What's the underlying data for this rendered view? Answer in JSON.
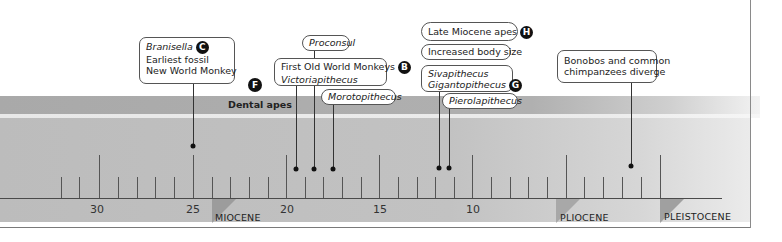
{
  "diagram": {
    "type": "timeline",
    "axis_unit": "millions of years ago",
    "tick_labels": [
      {
        "value": "30",
        "x": 97
      },
      {
        "value": "25",
        "x": 193
      },
      {
        "value": "20",
        "x": 287
      },
      {
        "value": "15",
        "x": 380
      },
      {
        "value": "10",
        "x": 473
      },
      {
        "value": "5",
        "x": 565
      }
    ],
    "major_ticks_x": [
      99,
      193,
      286,
      379,
      472,
      566,
      660
    ],
    "minor_ticks_x": [
      61,
      79,
      118,
      137,
      155,
      174,
      212,
      230,
      249,
      268,
      305,
      323,
      342,
      361,
      398,
      417,
      435,
      454,
      491,
      510,
      528,
      547,
      584,
      603,
      622,
      641
    ],
    "epochs": [
      {
        "label": "MIOCENE",
        "x": 212
      },
      {
        "label": "PLIOCENE",
        "x": 556
      },
      {
        "label": "PLEISTOCENE",
        "x": 660
      }
    ],
    "band": {
      "label": "Dental apes",
      "badge": "F"
    },
    "events": [
      {
        "id": "branisella",
        "lines": [
          "Branisella",
          "Earliest fossil",
          "New World Monkey"
        ],
        "italic_first": true,
        "badge": "C",
        "dot_x": 193,
        "dot_y": 146
      },
      {
        "id": "proconsul",
        "lines": [
          "Proconsul"
        ],
        "dot_x": 314,
        "dot_y": 169
      },
      {
        "id": "old-world",
        "lines": [
          "First Old World Monkeys",
          "Victoriapithecus"
        ],
        "badge": "B",
        "dot_x": 296,
        "dot_y": 169
      },
      {
        "id": "morotopithecus",
        "lines": [
          "Morotopithecus"
        ],
        "dot_x": 333,
        "dot_y": 169
      },
      {
        "id": "late-miocene",
        "lines": [
          "Late Miocene apes"
        ],
        "badge": "H"
      },
      {
        "id": "body-size",
        "lines": [
          "Increased body size"
        ]
      },
      {
        "id": "siva-giganto",
        "lines": [
          "Sivapithecus",
          "Gigantopithecus"
        ],
        "badge": "G",
        "dot_x": 439,
        "dot_y": 168
      },
      {
        "id": "pierolapithecus",
        "lines": [
          "Pierolapithecus"
        ],
        "dot_x": 449,
        "dot_y": 168
      },
      {
        "id": "bonobos",
        "lines": [
          "Bonobos and common",
          "chimpanzees diverge"
        ],
        "dot_x": 631,
        "dot_y": 166
      }
    ]
  },
  "colors": {
    "band_dark": "#a9a9a9",
    "band_main": "#bcbcbc",
    "axis": "#4a4a4a",
    "badge": "#111111"
  }
}
